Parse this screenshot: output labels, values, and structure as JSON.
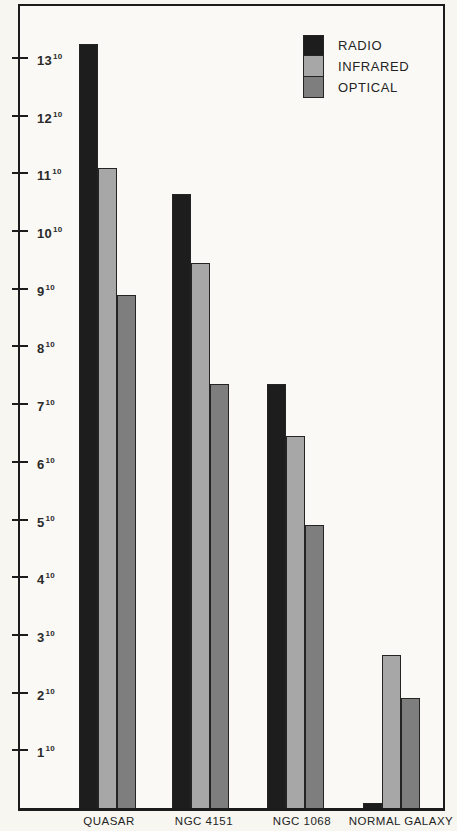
{
  "page": {
    "background": "#f7f6f1"
  },
  "legend": {
    "items": [
      {
        "label": "RADIO"
      },
      {
        "label": "INFRARED"
      },
      {
        "label": "OPTICAL"
      }
    ]
  },
  "yaxis": {
    "ticks": [
      {
        "base": "13",
        "exp": "10",
        "value": 13
      },
      {
        "base": "12",
        "exp": "10",
        "value": 12
      },
      {
        "base": "11",
        "exp": "10",
        "value": 11
      },
      {
        "base": "10",
        "exp": "10",
        "value": 10
      },
      {
        "base": "9",
        "exp": "10",
        "value": 9
      },
      {
        "base": "8",
        "exp": "10",
        "value": 8
      },
      {
        "base": "7",
        "exp": "10",
        "value": 7
      },
      {
        "base": "6",
        "exp": "10",
        "value": 6
      },
      {
        "base": "5",
        "exp": "10",
        "value": 5
      },
      {
        "base": "4",
        "exp": "10",
        "value": 4
      },
      {
        "base": "3",
        "exp": "10",
        "value": 3
      },
      {
        "base": "2",
        "exp": "10",
        "value": 2
      },
      {
        "base": "1",
        "exp": "10",
        "value": 1
      }
    ]
  },
  "xaxis": {
    "categories": [
      {
        "label": "QUASAR"
      },
      {
        "label": "NGC 4151"
      },
      {
        "label": "NGC 1068"
      },
      {
        "label": "NORMAL GALAXY"
      }
    ]
  },
  "chart_data": {
    "type": "bar",
    "title": "",
    "xlabel": "",
    "ylabel": "",
    "categories": [
      "QUASAR",
      "NGC 4151",
      "NGC 1068",
      "NORMAL GALAXY"
    ],
    "series": [
      {
        "name": "RADIO",
        "color": "#1d1d1d",
        "values": [
          13.25,
          10.65,
          7.35,
          0.08
        ]
      },
      {
        "name": "INFRARED",
        "color": "#a7a7a7",
        "values": [
          11.1,
          9.45,
          6.45,
          2.65
        ]
      },
      {
        "name": "OPTICAL",
        "color": "#7e7e7e",
        "values": [
          8.9,
          7.35,
          4.9,
          1.9
        ]
      }
    ],
    "ylim": [
      0,
      13.9
    ],
    "ytick_labels": [
      "1^10",
      "2^10",
      "3^10",
      "4^10",
      "5^10",
      "6^10",
      "7^10",
      "8^10",
      "9^10",
      "10^10",
      "11^10",
      "12^10",
      "13^10"
    ],
    "grid": false,
    "legend_position": "top-right"
  }
}
